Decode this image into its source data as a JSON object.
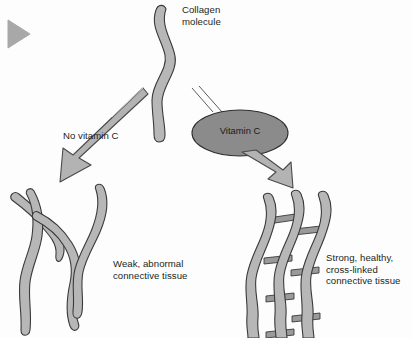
{
  "figure": {
    "background_color": "#fdfdfd",
    "marker_color": "#a8a8a8",
    "fiber_fill": "#b7b7b7",
    "fiber_stroke": "#3a3a3a",
    "ellipse_fill": "#8b8b8b",
    "ellipse_stroke": "#2e2e2e",
    "arrow_fill": "#b3b3b3",
    "arrow_stroke": "#4a4a4a",
    "crosslink_fill": "#9a9a9a",
    "text_color": "#231f20"
  },
  "marker": {
    "name": "play-triangle-marker"
  },
  "collagen": {
    "label": "Collagen\nmolecule"
  },
  "pathways": {
    "left": {
      "label": "No vitamin C",
      "outcome": "Weak, abnormal\nconnective tissue"
    },
    "right": {
      "label": "Vitamin C",
      "outcome": "Strong, healthy,\ncross-linked\nconnective tissue"
    }
  }
}
